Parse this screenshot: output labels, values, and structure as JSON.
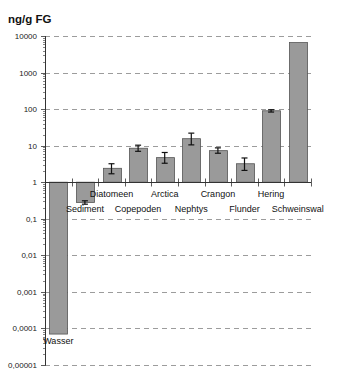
{
  "chart_data": {
    "type": "bar",
    "title": "",
    "ylabel": "ng/g FG",
    "xlabel": "",
    "yscale": "log",
    "ylim": [
      1e-05,
      10000
    ],
    "baseline": 1,
    "grid": "horizontal dashed at each decade",
    "legend": "none",
    "ytick_labels": [
      "10000",
      "1000",
      "100",
      "10",
      "1",
      "0,1",
      "0,01",
      "0,001",
      "0,0001",
      "0,00001"
    ],
    "ytick_values": [
      10000,
      1000,
      100,
      10,
      1,
      0.1,
      0.01,
      0.001,
      0.0001,
      1e-05
    ],
    "categories": [
      "Wasser",
      "Sediment",
      "Diatomeen",
      "Copepoden",
      "Arctica",
      "Nephtys",
      "Crangon",
      "Flunder",
      "Hering",
      "Schweinswal"
    ],
    "values": [
      7e-05,
      0.28,
      2.4,
      8.5,
      4.7,
      15.5,
      7.3,
      3.2,
      90,
      6600
    ],
    "error_low": [
      null,
      0.25,
      1.7,
      7.0,
      3.3,
      10.5,
      6.2,
      2.1,
      83,
      null
    ],
    "error_high": [
      null,
      0.31,
      3.2,
      10.3,
      6.5,
      22,
      8.7,
      4.6,
      96,
      null
    ]
  },
  "header": {
    "unit": "ng/g FG"
  },
  "colors": {
    "bar": "#9a9a9a",
    "bar_border": "#555555",
    "grid": "#9c9c9c",
    "axis": "#333333"
  }
}
